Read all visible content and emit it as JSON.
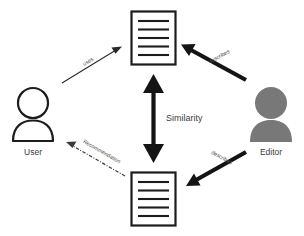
{
  "diagram": {
    "background_color": "#ffffff",
    "nodes": {
      "user": {
        "label": "User",
        "icon": "person-outline-icon",
        "style": "outline",
        "color": "#1c1c1c"
      },
      "editor": {
        "label": "Editor",
        "icon": "person-filled-icon",
        "style": "filled",
        "color": "#787878"
      },
      "document_top": {
        "label": "",
        "icon": "document-icon",
        "line_count": 5,
        "color": "#1c1c1c"
      },
      "document_bottom": {
        "label": "",
        "icon": "document-icon",
        "line_count": 5,
        "color": "#1c1c1c"
      }
    },
    "edges": [
      {
        "id": "user-uses-document",
        "label": "uses",
        "from": "user",
        "to": "document_top",
        "style": "thin-solid",
        "arrow": "single",
        "color": "#2a2a2a"
      },
      {
        "id": "editor-describes-top-document",
        "label": "describes",
        "from": "editor",
        "to": "document_top",
        "style": "thick-solid",
        "arrow": "single",
        "color": "#141414"
      },
      {
        "id": "editor-describes-bottom-document",
        "label": "describes",
        "from": "editor",
        "to": "document_bottom",
        "style": "thick-solid",
        "arrow": "single",
        "color": "#141414"
      },
      {
        "id": "document-recommendation-user",
        "label": "Recommendation",
        "from": "document_bottom",
        "to": "user",
        "style": "dash-dot",
        "arrow": "single",
        "color": "#3a3a3a"
      },
      {
        "id": "similarity-between-documents",
        "label": "Similarity",
        "from": "document_top",
        "to": "document_bottom",
        "style": "thick-solid",
        "arrow": "double",
        "color": "#141414"
      }
    ]
  }
}
